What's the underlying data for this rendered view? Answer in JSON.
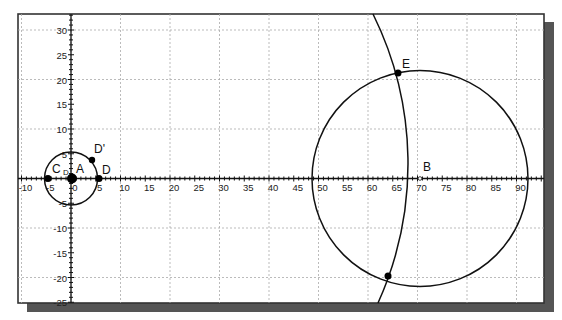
{
  "window": {
    "frame": {
      "left": 18,
      "top": 14,
      "right": 544,
      "bottom": 303
    },
    "shadow_color": "#555555",
    "border_color": "#333333",
    "background": "#ffffff"
  },
  "axes": {
    "origin_px": {
      "x": 71,
      "y": 178.5
    },
    "px_per_unit": 4.95,
    "x_range": [
      -11,
      95
    ],
    "y_range": [
      -25,
      33
    ],
    "x_tick_labels": [
      "-10",
      "-5",
      "0",
      "5",
      "10",
      "15",
      "20",
      "25",
      "30",
      "35",
      "40",
      "45",
      "50",
      "55",
      "60",
      "65",
      "70",
      "75",
      "80",
      "85",
      "90"
    ],
    "x_tick_values": [
      -10,
      -5,
      0,
      5,
      10,
      15,
      20,
      25,
      30,
      35,
      40,
      45,
      50,
      55,
      60,
      65,
      70,
      75,
      80,
      85,
      90
    ],
    "y_tick_labels": [
      "30",
      "25",
      "20",
      "15",
      "10",
      "5",
      "-5",
      "-10",
      "-15",
      "-20",
      "-25"
    ],
    "y_tick_values": [
      30,
      25,
      20,
      15,
      10,
      5,
      -5,
      -10,
      -15,
      -20,
      -25
    ],
    "grid_step": 10,
    "grid": true
  },
  "objects": {
    "circle_small": {
      "center": "A",
      "center_xy": [
        0,
        0
      ],
      "radius": 5.3
    },
    "circle_large": {
      "center": "B",
      "center_xy": [
        70.5,
        0
      ],
      "radius": 21.8
    },
    "arc": {
      "center_approx": [
        0,
        2
      ],
      "radius_approx": 68.3
    }
  },
  "points": [
    {
      "name": "A",
      "label": "A",
      "x": 0,
      "y": 0,
      "size": "large"
    },
    {
      "name": "C",
      "label": "C",
      "x": -4.7,
      "y": 0,
      "size": "medium"
    },
    {
      "name": "D",
      "label": "D",
      "x": 5.7,
      "y": 0,
      "size": "medium"
    },
    {
      "name": "D-prime",
      "label": "D'",
      "x": 4.3,
      "y": 3.7,
      "size": "medium"
    },
    {
      "name": "B",
      "label": "B",
      "x": 70.5,
      "y": 0,
      "size": "small"
    },
    {
      "name": "E",
      "label": "E",
      "x": 66,
      "y": 21.2,
      "size": "medium"
    },
    {
      "name": "F",
      "label": "",
      "x": 64,
      "y": -19.8,
      "size": "medium"
    }
  ],
  "labels": {
    "A": "A",
    "B": "B",
    "C": "C",
    "D": "D",
    "D_prime": "D'",
    "E": "E",
    "origin_small": "D"
  }
}
